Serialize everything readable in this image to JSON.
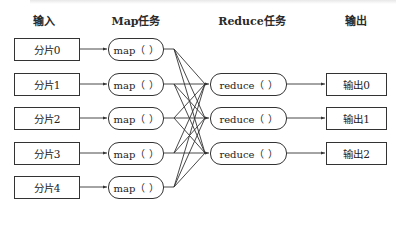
{
  "headers": {
    "input": "输入",
    "map": "Map任务",
    "reduce": "Reduce任务",
    "output": "输出"
  },
  "inputs": [
    {
      "label": "分片0"
    },
    {
      "label": "分片1"
    },
    {
      "label": "分片2"
    },
    {
      "label": "分片3"
    },
    {
      "label": "分片4"
    }
  ],
  "maps": [
    {
      "label": "map（ ）"
    },
    {
      "label": "map（ ）"
    },
    {
      "label": "map（ ）"
    },
    {
      "label": "map（ ）"
    },
    {
      "label": "map（ ）"
    }
  ],
  "reduces": [
    {
      "label": "reduce（ ）"
    },
    {
      "label": "reduce（ ）"
    },
    {
      "label": "reduce（ ）"
    }
  ],
  "outputs": [
    {
      "label": "输出0"
    },
    {
      "label": "输出1"
    },
    {
      "label": "输出2"
    }
  ],
  "colors": {
    "line": "#333333",
    "background": "#ffffff"
  }
}
